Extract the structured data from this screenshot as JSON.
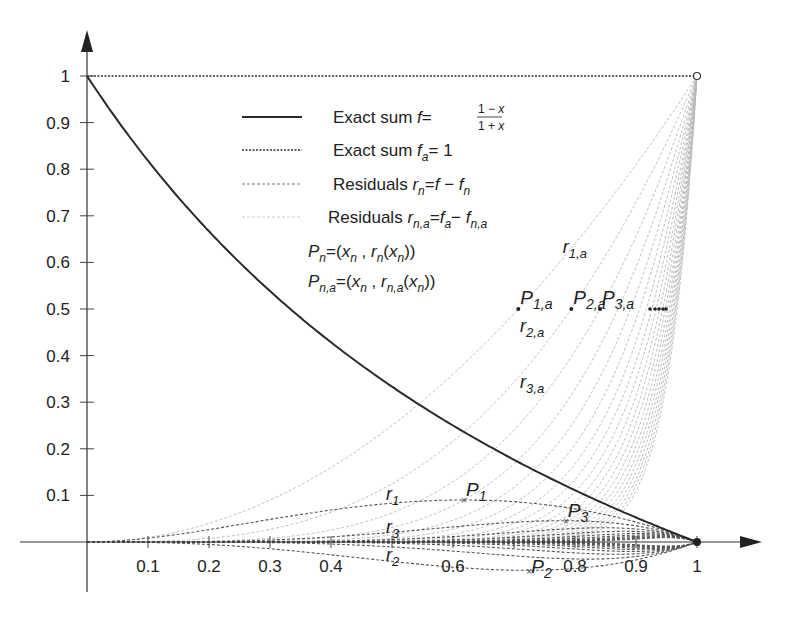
{
  "chart_data": {
    "type": "line",
    "title": "",
    "xlabel": "",
    "ylabel": "",
    "xlim": [
      0,
      1
    ],
    "ylim": [
      -0.08,
      1.1
    ],
    "grid": false,
    "x_ticks": [
      0.1,
      0.2,
      0.3,
      0.4,
      0.5,
      0.6,
      0.7,
      0.8,
      0.9,
      1
    ],
    "x_tick_labels": [
      "0.1",
      "0.2",
      "0.3",
      "0.4",
      "",
      "0.6",
      "",
      "0.8",
      "0.9",
      "1"
    ],
    "y_ticks": [
      0.1,
      0.2,
      0.3,
      0.4,
      0.5,
      0.6,
      0.7,
      0.8,
      0.9,
      1
    ],
    "y_tick_labels": [
      "0.1",
      "0.2",
      "0.3",
      "0.4",
      "0.5",
      "0.6",
      "0.7",
      "0.8",
      "0.9",
      "1"
    ],
    "legend": {
      "position": "upper center",
      "entries": [
        {
          "style": "solid",
          "text": "Exact sum f = (1−x)/(1+x)"
        },
        {
          "style": "dense-dotted",
          "text": "Exact sum f_a = 1"
        },
        {
          "style": "dashed",
          "text": "Residuals r_n = f − f_n"
        },
        {
          "style": "light-dashed",
          "text": "Residuals r_{n,a} = f_a − f_{n,a}"
        }
      ],
      "point_definitions": [
        "P_n = (x_n , r_n(x_n))",
        "P_{n,a} = (x_n , r_{n,a}(x_n))"
      ]
    },
    "series": [
      {
        "name": "Exact sum f",
        "formula": "(1-x)/(1+x)",
        "x": [
          0,
          0.1,
          0.2,
          0.3,
          0.4,
          0.5,
          0.6,
          0.7,
          0.8,
          0.9,
          1
        ],
        "values": [
          1,
          0.818,
          0.667,
          0.538,
          0.429,
          0.333,
          0.25,
          0.176,
          0.111,
          0.053,
          0
        ]
      },
      {
        "name": "Exact sum f_a",
        "formula": "1",
        "x": [
          0,
          1
        ],
        "values": [
          1,
          1
        ]
      },
      {
        "name": "r_1",
        "formula": "(1-x)x^2/(1+x)",
        "x": [
          0,
          0.2,
          0.4,
          0.6,
          0.8,
          1
        ],
        "values": [
          0,
          0.027,
          0.069,
          0.09,
          0.071,
          0
        ]
      },
      {
        "name": "r_2",
        "formula": "-(1-x)x^3/(1+x)",
        "x": [
          0,
          0.2,
          0.4,
          0.6,
          0.8,
          1
        ],
        "values": [
          0,
          -0.005,
          -0.027,
          -0.054,
          -0.057,
          0
        ]
      },
      {
        "name": "r_3",
        "formula": "(1-x)x^4/(1+x)",
        "x": [
          0,
          0.2,
          0.4,
          0.6,
          0.8,
          1
        ],
        "values": [
          0,
          0.001,
          0.011,
          0.032,
          0.046,
          0
        ]
      },
      {
        "name": "r_{1,a}",
        "formula": "x^2",
        "x": [
          0,
          0.25,
          0.5,
          0.75,
          1
        ],
        "values": [
          0,
          0.0625,
          0.25,
          0.5625,
          1
        ]
      },
      {
        "name": "r_{2,a}",
        "formula": "x^3",
        "x": [
          0,
          0.25,
          0.5,
          0.75,
          1
        ],
        "values": [
          0,
          0.0156,
          0.125,
          0.4219,
          1
        ]
      },
      {
        "name": "r_{3,a}",
        "formula": "x^4",
        "x": [
          0,
          0.25,
          0.5,
          0.75,
          1
        ],
        "values": [
          0,
          0.0039,
          0.0625,
          0.3164,
          1
        ]
      }
    ],
    "n_residual_curves": 20,
    "points": [
      {
        "label": "P_1",
        "x": 0.618,
        "y": 0.09
      },
      {
        "label": "P_2",
        "x": 0.725,
        "y": -0.062
      },
      {
        "label": "P_3",
        "x": 0.785,
        "y": 0.045
      },
      {
        "label": "P_{1,a}",
        "x": 0.707,
        "y": 0.5
      },
      {
        "label": "P_{2,a}",
        "x": 0.794,
        "y": 0.5
      },
      {
        "label": "P_{3,a}",
        "x": 0.841,
        "y": 0.5
      }
    ],
    "annotations": [
      {
        "text": "r_1",
        "x": 0.49,
        "y": 0.09
      },
      {
        "text": "r_2",
        "x": 0.49,
        "y": -0.04
      },
      {
        "text": "r_3",
        "x": 0.49,
        "y": 0.02
      },
      {
        "text": "r_{1,a}",
        "x": 0.78,
        "y": 0.62
      },
      {
        "text": "r_{2,a}",
        "x": 0.71,
        "y": 0.45
      },
      {
        "text": "r_{3,a}",
        "x": 0.71,
        "y": 0.33
      }
    ]
  },
  "legend_labels": {
    "f_prefix": "Exact sum ",
    "fa_prefix": "Exact sum ",
    "rn_prefix": "Residuals ",
    "rna_prefix": "Residuals "
  },
  "colors": {
    "exact_sum": "#2a2a2a",
    "exact_sum_a": "#333333",
    "residual": "#555555",
    "residual_a": "#b8b8b8",
    "axis": "#333333",
    "text": "#222222"
  }
}
